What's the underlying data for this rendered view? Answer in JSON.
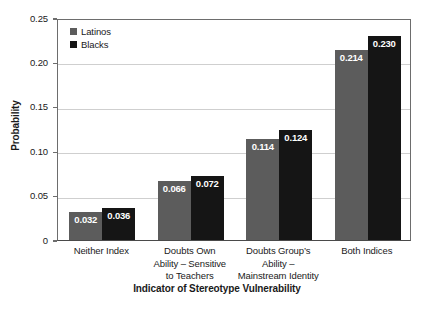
{
  "chart_data": {
    "type": "bar",
    "title": "",
    "xlabel": "Indicator of Stereotype Vulnerability",
    "ylabel": "Probability",
    "ylim": [
      0,
      0.25
    ],
    "ytick_labels": [
      "0.25",
      "0.20",
      "0.15",
      "0.10",
      "0.05",
      "0"
    ],
    "ytick_values": [
      0.25,
      0.2,
      0.15,
      0.1,
      0.05,
      0
    ],
    "grid": true,
    "legend_position": "top-left",
    "categories": [
      "Neither Index",
      "Doubts Own Ability – Sensitive to Teachers",
      "Doubts Group’s Ability – Mainstream Identity",
      "Both Indices"
    ],
    "category_lines": [
      [
        "Neither Index"
      ],
      [
        "Doubts Own",
        "Ability – Sensitive",
        "to Teachers"
      ],
      [
        "Doubts Group’s",
        "Ability –",
        "Mainstream Identity"
      ],
      [
        "Both Indices"
      ]
    ],
    "series": [
      {
        "name": "Latinos",
        "color": "#5c5c5c",
        "values": [
          0.032,
          0.066,
          0.114,
          0.214
        ],
        "labels": [
          "0.032",
          "0.066",
          "0.114",
          "0.214"
        ]
      },
      {
        "name": "Blacks",
        "color": "#151515",
        "values": [
          0.036,
          0.072,
          0.124,
          0.23
        ],
        "labels": [
          "0.036",
          "0.072",
          "0.124",
          "0.230"
        ]
      }
    ]
  },
  "legend": {
    "items": [
      {
        "label": "Latinos",
        "color": "#5c5c5c"
      },
      {
        "label": "Blacks",
        "color": "#151515"
      }
    ]
  }
}
